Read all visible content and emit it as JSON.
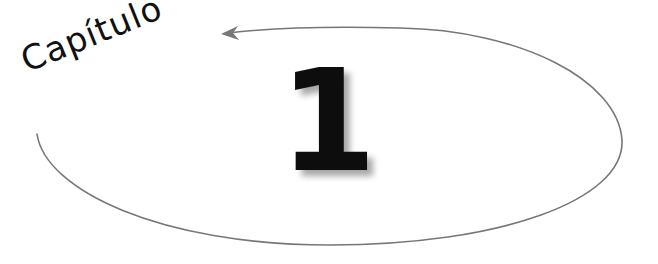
{
  "heading": {
    "label": "Capítulo",
    "number": "1"
  },
  "decoration": {
    "ellipse_color": "#777777",
    "text_color": "#111111"
  }
}
